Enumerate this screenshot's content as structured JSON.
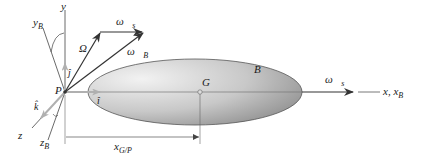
{
  "diagram": {
    "body": {
      "label": "B",
      "fill_light": "#e8e8e8",
      "fill_dark": "#9a9a9a",
      "stroke": "#555555"
    },
    "center_of_mass": {
      "label": "G"
    },
    "pivot": {
      "label": "P"
    },
    "axes": {
      "y": {
        "label": "y"
      },
      "yB": {
        "label": "y",
        "sub": "B"
      },
      "z": {
        "label": "z"
      },
      "zB": {
        "label": "z",
        "sub": "B"
      },
      "x": {
        "label": "x, x",
        "sub": "B"
      }
    },
    "unit_vectors": {
      "i": "î",
      "j": "ĵ",
      "k": "k̂"
    },
    "vectors": {
      "Omega": {
        "label": "Ω⃗"
      },
      "omega_s_top": {
        "label": "ω⃗",
        "sub": "s"
      },
      "omega_B": {
        "label": "ω⃗",
        "sub": "B"
      },
      "omega_s_right": {
        "label": "ω⃗",
        "sub": "s"
      }
    },
    "dimension": {
      "label": "x",
      "sub": "G/P"
    },
    "colors": {
      "line": "#333333",
      "axis_light": "#888888",
      "unit_vector": "#b0b0b0"
    }
  }
}
